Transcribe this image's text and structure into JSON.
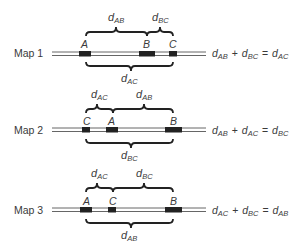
{
  "maps": [
    {
      "label": "Map 1",
      "markers": [
        "A",
        "B",
        "C"
      ],
      "top_braces": [
        {
          "d": "d",
          "sub": "AB"
        },
        {
          "d": "d",
          "sub": "BC"
        }
      ],
      "bottom_brace": {
        "d": "d",
        "sub": "AC"
      },
      "equation": {
        "t1": "d",
        "s1": "AB",
        "op": "+",
        "t2": "d",
        "s2": "BC",
        "eq": "=",
        "t3": "d",
        "s3": "AC"
      }
    },
    {
      "label": "Map 2",
      "markers": [
        "C",
        "A",
        "B"
      ],
      "top_braces": [
        {
          "d": "d",
          "sub": "AC"
        },
        {
          "d": "d",
          "sub": "AB"
        }
      ],
      "bottom_brace": {
        "d": "d",
        "sub": "BC"
      },
      "equation": {
        "t1": "d",
        "s1": "AB",
        "op": "+",
        "t2": "d",
        "s2": "AC",
        "eq": "=",
        "t3": "d",
        "s3": "BC"
      }
    },
    {
      "label": "Map 3",
      "markers": [
        "A",
        "C",
        "B"
      ],
      "top_braces": [
        {
          "d": "d",
          "sub": "AC"
        },
        {
          "d": "d",
          "sub": "BC"
        }
      ],
      "bottom_brace": {
        "d": "d",
        "sub": "AB"
      },
      "equation": {
        "t1": "d",
        "s1": "AC",
        "op": "+",
        "t2": "d",
        "s2": "BC",
        "eq": "=",
        "t3": "d",
        "s3": "AB"
      }
    }
  ],
  "colors": {
    "ink": "#222222",
    "line": "#555555",
    "text": "#3a3a3a"
  }
}
